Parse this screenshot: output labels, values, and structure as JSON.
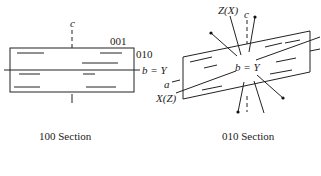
{
  "figures": [
    {
      "id": "section-100",
      "caption": "100 Section",
      "labels": {
        "c_axis": "c",
        "plane_001": "001",
        "plane_010": "010",
        "b_axis": "b = Y"
      }
    },
    {
      "id": "section-010",
      "caption": "010 Section",
      "labels": {
        "z_axis": "Z(X)",
        "c_axis": "c",
        "b_axis": "b = Y",
        "a_axis": "a",
        "x_axis": "X(Z)"
      }
    }
  ]
}
